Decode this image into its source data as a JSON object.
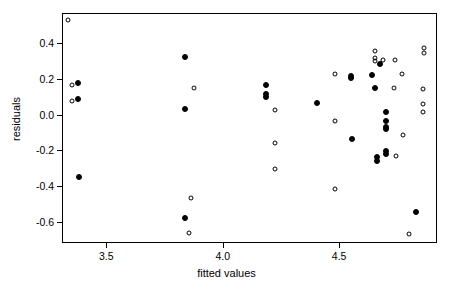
{
  "chart_data": {
    "type": "scatter",
    "title": "",
    "xlabel": "fitted values",
    "ylabel": "residuals",
    "xlim": [
      3.31,
      4.92
    ],
    "ylim": [
      -0.72,
      0.57
    ],
    "grid": false,
    "legend": null,
    "xticks": [
      3.5,
      4.0,
      4.5
    ],
    "xticklabels": [
      "3.5",
      "4.0",
      "4.5"
    ],
    "yticks": [
      0.4,
      0.2,
      0.0,
      -0.2,
      -0.4,
      -0.6
    ],
    "yticklabels": [
      "0.4",
      "0.2",
      "0.0",
      "-0.2",
      "-0.4",
      "-0.6"
    ],
    "series": [
      {
        "name": "open",
        "marker": "open-circle",
        "color": "#000000",
        "points": [
          [
            3.335,
            0.53
          ],
          [
            3.355,
            0.168
          ],
          [
            3.355,
            0.078
          ],
          [
            3.875,
            0.15
          ],
          [
            3.865,
            -0.468
          ],
          [
            3.855,
            -0.665
          ],
          [
            4.225,
            0.028
          ],
          [
            4.225,
            -0.16
          ],
          [
            4.225,
            -0.307
          ],
          [
            4.48,
            0.228
          ],
          [
            4.48,
            -0.035
          ],
          [
            4.48,
            -0.418
          ],
          [
            4.655,
            0.357
          ],
          [
            4.655,
            0.318
          ],
          [
            4.655,
            0.303
          ],
          [
            4.69,
            0.308
          ],
          [
            4.74,
            0.308
          ],
          [
            4.735,
            0.148
          ],
          [
            4.77,
            0.228
          ],
          [
            4.775,
            -0.112
          ],
          [
            4.745,
            -0.232
          ],
          [
            4.8,
            -0.668
          ],
          [
            4.865,
            0.372
          ],
          [
            4.865,
            0.345
          ],
          [
            4.86,
            0.143
          ],
          [
            4.86,
            0.058
          ],
          [
            4.86,
            0.015
          ]
        ]
      },
      {
        "name": "filled",
        "marker": "filled-circle",
        "color": "#000000",
        "points": [
          [
            3.38,
            0.178
          ],
          [
            3.38,
            0.085
          ],
          [
            3.385,
            -0.35
          ],
          [
            3.84,
            0.325
          ],
          [
            3.84,
            0.03
          ],
          [
            3.84,
            -0.58
          ],
          [
            4.185,
            0.168
          ],
          [
            4.185,
            0.118
          ],
          [
            4.185,
            0.098
          ],
          [
            4.405,
            0.065
          ],
          [
            4.55,
            0.205
          ],
          [
            4.55,
            0.218
          ],
          [
            4.555,
            -0.138
          ],
          [
            4.64,
            0.225
          ],
          [
            4.655,
            0.148
          ],
          [
            4.675,
            0.282
          ],
          [
            4.7,
            0.012
          ],
          [
            4.7,
            -0.038
          ],
          [
            4.7,
            -0.07
          ],
          [
            4.7,
            -0.082
          ],
          [
            4.662,
            -0.24
          ],
          [
            4.662,
            -0.258
          ],
          [
            4.7,
            -0.202
          ],
          [
            4.7,
            -0.222
          ],
          [
            4.83,
            -0.545
          ]
        ]
      }
    ]
  }
}
